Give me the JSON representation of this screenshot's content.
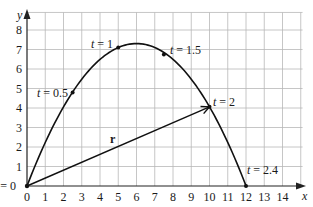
{
  "chart_data": {
    "type": "line",
    "title": "",
    "xlabel": "x",
    "ylabel": "y",
    "xlim": [
      0,
      15
    ],
    "ylim": [
      0,
      8.9
    ],
    "grid": true,
    "x_ticks": [
      "0",
      "1",
      "2",
      "3",
      "4",
      "5",
      "6",
      "7",
      "8",
      "9",
      "10",
      "11",
      "12",
      "13",
      "14"
    ],
    "y_ticks": [
      "1",
      "2",
      "3",
      "4",
      "5",
      "6",
      "7",
      "8"
    ],
    "origin_label": "t = 0",
    "series": [
      {
        "name": "trajectory",
        "parametric": "x = 5t, y ≈ 12.17t − 5.07t²",
        "t_range": [
          0,
          2.4
        ],
        "x": [
          0,
          1,
          2,
          2.5,
          3,
          4,
          5,
          6,
          7,
          7.5,
          8,
          9,
          10,
          11,
          12
        ],
        "y": [
          0,
          2.23,
          4.06,
          4.8,
          5.48,
          6.49,
          7.1,
          7.3,
          7.09,
          6.75,
          6.49,
          5.48,
          4.06,
          2.23,
          0
        ]
      }
    ],
    "marked_points": [
      {
        "label": "t = 0.5",
        "x": 2.5,
        "y": 4.8
      },
      {
        "label": "t = 1",
        "x": 5,
        "y": 7.1
      },
      {
        "label": "t = 1.5",
        "x": 7.5,
        "y": 6.75
      },
      {
        "label": "t = 2",
        "x": 10,
        "y": 4.06
      },
      {
        "label": "t = 2.4",
        "x": 12,
        "y": 0
      }
    ],
    "vector": {
      "label": "r",
      "from": [
        0,
        0
      ],
      "to": [
        10,
        4.06
      ]
    }
  },
  "labels": {
    "x_axis": "x",
    "y_axis": "y",
    "origin": "t = 0",
    "vector": "r",
    "t05": "t = 0.5",
    "t1": "t = 1",
    "t15": "t = 1.5",
    "t2": "t = 2",
    "t24": "t = 2.4",
    "xt": [
      "0",
      "1",
      "2",
      "3",
      "4",
      "5",
      "6",
      "7",
      "8",
      "9",
      "10",
      "11",
      "12",
      "13",
      "14"
    ],
    "yt": [
      "1",
      "2",
      "3",
      "4",
      "5",
      "6",
      "7",
      "8"
    ]
  }
}
